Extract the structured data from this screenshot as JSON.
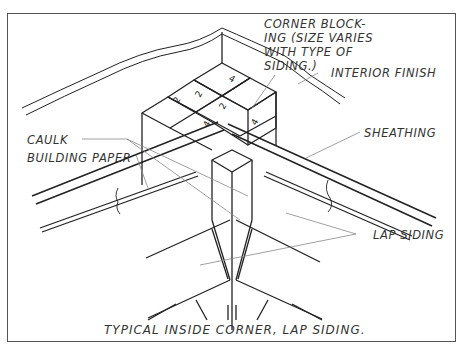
{
  "figure": {
    "caption": "TYPICAL INSIDE CORNER, LAP SIDING.",
    "line_color": "#222222",
    "leader_color": "#888888"
  },
  "labels": {
    "corner_blocking": [
      "CORNER BLOCK-",
      "ING (SIZE VARIES",
      "WITH TYPE OF",
      "SIDING.)"
    ],
    "interior_finish": "INTERIOR FINISH",
    "sheathing": "SHEATHING",
    "caulk": "CAULK",
    "building_paper": "BUILDING PAPER",
    "lap_siding": "LAP SIDING"
  },
  "blocking_marks": [
    "2",
    "2",
    "2",
    "4",
    "4",
    "4"
  ]
}
